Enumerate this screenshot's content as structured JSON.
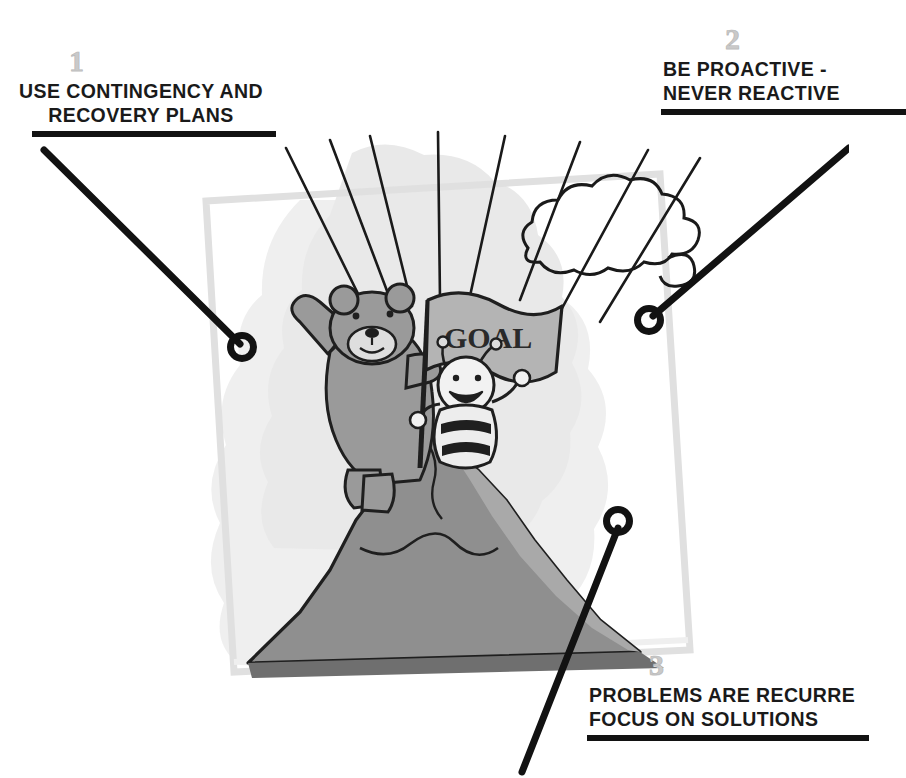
{
  "image": {
    "title": "Goal achievement illustration with three numbered callouts",
    "style": "grayscale cartoon clip-art"
  },
  "callouts": [
    {
      "number": "1",
      "line1": "USE CONTINGENCY AND",
      "line2": "RECOVERY PLANS",
      "marker_label": "callout-marker-1"
    },
    {
      "number": "2",
      "line1": "BE PROACTIVE -",
      "line2": "NEVER REACTIVE",
      "marker_label": "callout-marker-2"
    },
    {
      "number": "3",
      "line1": "PROBLEMS ARE RECURRE",
      "line2": "FOCUS ON SOLUTIONS",
      "marker_label": "callout-marker-3"
    }
  ],
  "illustration": {
    "flag_text": "GOAL",
    "characters": [
      "teddy-bear",
      "bee"
    ],
    "elements": [
      "mountain-peak",
      "cloud",
      "parachute-strings",
      "picture-frame"
    ]
  },
  "colors": {
    "ink": "#1a1a1a",
    "number_gray": "#c9c9c9",
    "frame_gray": "#e3e3e3",
    "mountain_dark": "#8c8c8c",
    "mountain_mid": "#a8a8a8",
    "wash_gray": "#e9e9e9",
    "flag_gray": "#b4b4b4",
    "bear_gray": "#9a9a9a",
    "paper": "#ffffff"
  }
}
